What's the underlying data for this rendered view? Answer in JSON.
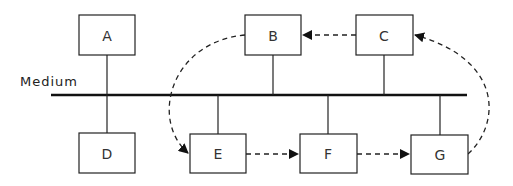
{
  "diagram": {
    "medium_label": "Medium",
    "nodes": [
      {
        "id": "A",
        "label": "A"
      },
      {
        "id": "B",
        "label": "B"
      },
      {
        "id": "C",
        "label": "C"
      },
      {
        "id": "D",
        "label": "D"
      },
      {
        "id": "E",
        "label": "E"
      },
      {
        "id": "F",
        "label": "F"
      },
      {
        "id": "G",
        "label": "G"
      }
    ],
    "connections_to_medium": [
      "A",
      "B",
      "C",
      "D",
      "E",
      "F",
      "G"
    ],
    "flow": [
      {
        "from": "E",
        "to": "F",
        "style": "dashed-arrow"
      },
      {
        "from": "F",
        "to": "G",
        "style": "dashed-arrow"
      },
      {
        "from": "G",
        "to": "C",
        "style": "dashed-curved-arrow"
      },
      {
        "from": "C",
        "to": "B",
        "style": "dashed-arrow"
      },
      {
        "from": "B",
        "to": "E",
        "style": "dashed-curved-arrow"
      }
    ],
    "colors": {
      "line": "#222222",
      "background": "#ffffff"
    }
  }
}
